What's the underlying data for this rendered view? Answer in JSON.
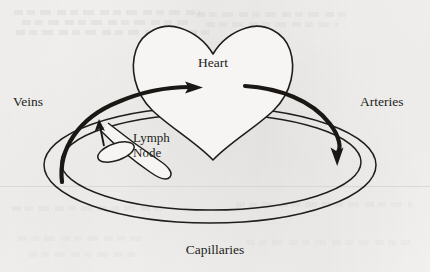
{
  "figure": {
    "kind": "line-diagram",
    "background_color": "#f6f5f3",
    "ink_color": "#211d1a",
    "labels": {
      "heart": "Heart",
      "veins": "Veins",
      "arteries": "Arteries",
      "lymph_node_line1": "Lymph",
      "lymph_node_line2": "Node",
      "capillaries": "Capillaries"
    },
    "parts": [
      {
        "name": "heart-outline",
        "shape": "valentine-heart",
        "style": "thin-outline"
      },
      {
        "name": "capillary-loop",
        "shape": "concentric-ellipses",
        "count": 2,
        "style": "thin-outline"
      },
      {
        "name": "vein-flow-arrow",
        "shape": "curved-arrow",
        "direction": "toward-heart",
        "style": "thick-solid"
      },
      {
        "name": "artery-flow-arrow",
        "shape": "curved-arrow",
        "direction": "away-from-heart",
        "style": "thick-solid"
      },
      {
        "name": "lymph-node",
        "shape": "tilted-ellipse",
        "style": "thin-outline-filled-white"
      },
      {
        "name": "lymph-vessel",
        "shape": "double-line-duct",
        "style": "thin-outline"
      },
      {
        "name": "lymph-flow-arrow",
        "shape": "straight-arrow",
        "direction": "toward-vein",
        "style": "thin-solid"
      }
    ]
  }
}
